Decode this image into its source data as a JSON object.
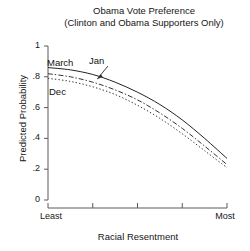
{
  "title": {
    "line1": "Obama Vote Preference",
    "line2": "(Clinton and Obama Supporters Only)"
  },
  "axes": {
    "ylabel": "Predicted Probability",
    "xlabel": "Racial Resentment",
    "yticks": [
      "0",
      ".2",
      ".4",
      ".6",
      ".8",
      "1"
    ],
    "xtick_low": "Least",
    "xtick_high": "Most"
  },
  "annotations": {
    "march": "March",
    "jan": "Jan",
    "dec": "Dec"
  },
  "chart_data": {
    "type": "line",
    "title": "Obama Vote Preference (Clinton and Obama Supporters Only)",
    "xlabel": "Racial Resentment",
    "ylabel": "Predicted Probability",
    "xlim": [
      0,
      1
    ],
    "ylim": [
      0,
      1
    ],
    "grid": false,
    "legend_position": "inline-labels",
    "x_tick_labels": [
      "Least",
      "",
      "",
      "",
      "Most"
    ],
    "x_tick_positions": [
      0,
      0.25,
      0.5,
      0.75,
      1
    ],
    "y_tick_labels": [
      "0",
      ".2",
      ".4",
      ".6",
      ".8",
      "1"
    ],
    "y_tick_positions": [
      0,
      0.2,
      0.4,
      0.6,
      0.8,
      1
    ],
    "x": [
      0,
      0.125,
      0.25,
      0.375,
      0.5,
      0.625,
      0.75,
      0.875,
      1
    ],
    "series": [
      {
        "name": "March",
        "style": "solid",
        "color": "#222222",
        "values": [
          0.86,
          0.845,
          0.815,
          0.765,
          0.7,
          0.62,
          0.52,
          0.4,
          0.27
        ]
      },
      {
        "name": "Jan",
        "style": "dash-dot",
        "color": "#333333",
        "values": [
          0.82,
          0.8,
          0.765,
          0.715,
          0.65,
          0.565,
          0.465,
          0.35,
          0.23
        ]
      },
      {
        "name": "Dec",
        "style": "dotted",
        "color": "#3a3a3a",
        "values": [
          0.79,
          0.77,
          0.735,
          0.685,
          0.615,
          0.53,
          0.43,
          0.32,
          0.21
        ]
      }
    ]
  }
}
